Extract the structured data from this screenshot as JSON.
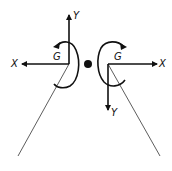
{
  "diagram": {
    "left_frame": {
      "x_label": "X",
      "y_label": "Y",
      "rotation_label": "G"
    },
    "right_frame": {
      "x_label": "X",
      "y_label": "Y",
      "rotation_label": "G"
    },
    "colors": {
      "stroke": "#111111",
      "background": "#ffffff"
    }
  }
}
